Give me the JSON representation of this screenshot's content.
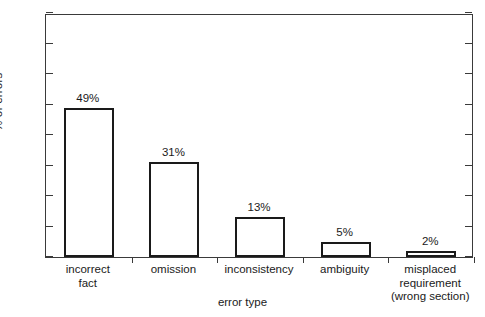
{
  "chart_data": {
    "type": "bar",
    "title": "",
    "categories": [
      "incorrect\nfact",
      "omission",
      "inconsistency",
      "ambiguity",
      "misplaced\nrequirement\n(wrong section)"
    ],
    "values": [
      49,
      31,
      13,
      5,
      2
    ],
    "data_labels": [
      "49%",
      "31%",
      "13%",
      "5%",
      "2%"
    ],
    "xlabel": "error type",
    "ylabel": "% of errors",
    "ylim": [
      0,
      80
    ],
    "ytick_values": [
      0,
      10,
      20,
      30,
      40,
      50,
      60,
      70,
      80
    ],
    "ytick_labels": [
      "0",
      "10",
      "20",
      "30",
      "40",
      "50",
      "60",
      "70",
      "80"
    ],
    "grid": false,
    "legend": false,
    "bar_fill_color": "#ffffff",
    "bar_edge_color": "#1a1a1a",
    "axis_color": "#3a3a3a",
    "background_color": "#ffffff"
  }
}
